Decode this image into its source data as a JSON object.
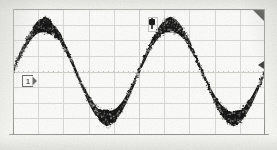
{
  "instrument": {
    "display_type": "oscilloscope-graticule",
    "background_color": "#f7f7f4",
    "grid_color": "#dcdcd6",
    "frame_color": "#8e8e8a",
    "trace_color": "#151513"
  },
  "graticule": {
    "horizontal_divisions": 10,
    "vertical_divisions": 8,
    "subdivision_ticks_per_division": 5,
    "center_axes_visible": true,
    "grid_visible": true
  },
  "markers": {
    "channel_ground": {
      "name": "channel-1-ground-reference",
      "label": "1",
      "edge": "left",
      "vertical_division": 0
    },
    "trigger_position": {
      "name": "trigger-position",
      "label": "T",
      "edge": "top",
      "horizontal_division": 0
    },
    "trigger_level": {
      "name": "trigger-level",
      "label": "",
      "edge": "right",
      "vertical_division": 0.4
    },
    "corner_flag": {
      "name": "display-corner-flag",
      "label": ""
    }
  },
  "chart_data": {
    "type": "line",
    "title": "",
    "subtitle": "",
    "xlabel": "",
    "ylabel": "",
    "xlim": [
      0,
      10
    ],
    "ylim": [
      -4,
      4
    ],
    "grid": true,
    "legend": "none",
    "annotations": [
      "channel 1 ground reference at 0 divisions (left edge)",
      "trigger position marker at 0 divisions (top centre)",
      "trigger level marker on right edge"
    ],
    "series": [
      {
        "name": "Channel 1",
        "waveform": "sine",
        "color": "#151513",
        "amplitude_divisions": 3.0,
        "offset_divisions": 0.0,
        "cycles_on_screen": 2.0,
        "phase_degrees": 0,
        "trace_thickness_divisions": 0.55,
        "noise": true,
        "x": [
          0.0,
          0.25,
          0.5,
          0.75,
          1.0,
          1.25,
          1.5,
          1.75,
          2.0,
          2.25,
          2.5,
          2.75,
          3.0,
          3.25,
          3.5,
          3.75,
          4.0,
          4.25,
          4.5,
          4.75,
          5.0,
          5.25,
          5.5,
          5.75,
          6.0,
          6.25,
          6.5,
          6.75,
          7.0,
          7.25,
          7.5,
          7.75,
          8.0,
          8.25,
          8.5,
          8.75,
          9.0,
          9.25,
          9.5,
          9.75,
          10.0
        ],
        "values": [
          0.0,
          0.92,
          1.77,
          2.49,
          2.85,
          2.99,
          2.85,
          2.49,
          1.77,
          0.92,
          0.0,
          -0.92,
          -1.77,
          -2.49,
          -2.85,
          -2.99,
          -2.85,
          -2.49,
          -1.77,
          -0.92,
          0.0,
          0.92,
          1.77,
          2.49,
          2.85,
          2.99,
          2.85,
          2.49,
          1.77,
          0.92,
          0.0,
          -0.92,
          -1.77,
          -2.49,
          -2.85,
          -2.99,
          -2.85,
          -2.49,
          -1.77,
          -0.92,
          0.0
        ]
      }
    ]
  }
}
